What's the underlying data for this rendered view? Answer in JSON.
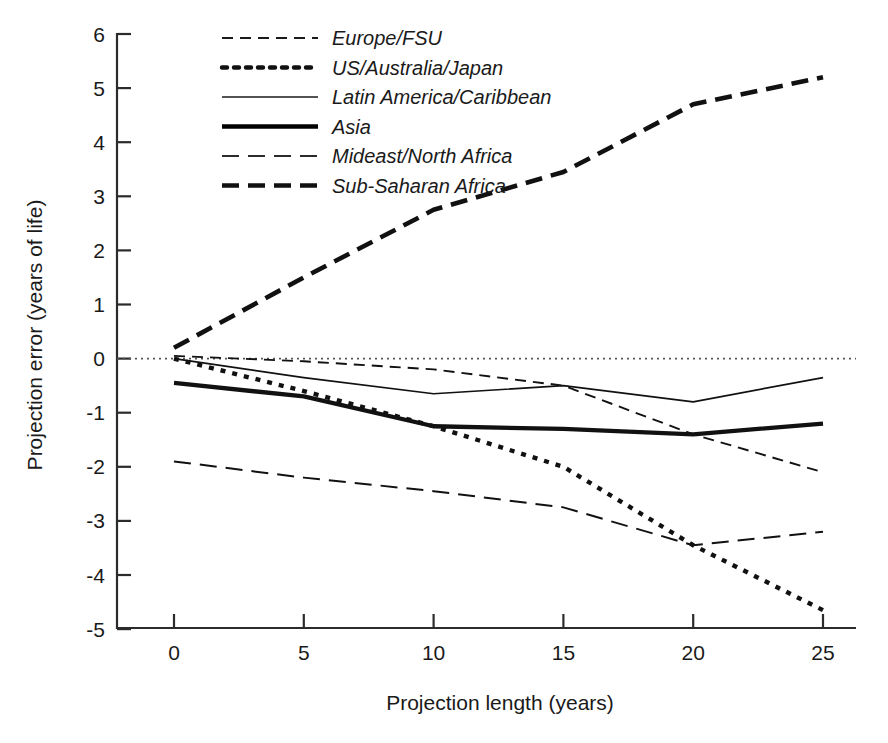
{
  "chart_data": {
    "type": "line",
    "title": "",
    "xlabel": "Projection length (years)",
    "ylabel": "Projection error (years of life)",
    "x": [
      0,
      5,
      10,
      15,
      20,
      25
    ],
    "xlim": [
      -1.5,
      26.5
    ],
    "ylim": [
      -5,
      6
    ],
    "xticks": [
      "0",
      "5",
      "10",
      "15",
      "20",
      "25"
    ],
    "yticks": [
      "6",
      "5",
      "4",
      "3",
      "2",
      "1",
      "0",
      "-1",
      "-2",
      "-3",
      "-4",
      "-5"
    ],
    "grid": false,
    "legend_position": "top-left-inside",
    "zero_reference_line": 0,
    "series": [
      {
        "name": "Europe/FSU",
        "style": "dashed-thin",
        "color": "#1a1a1a",
        "values": [
          0.05,
          -0.05,
          -0.2,
          -0.5,
          -1.4,
          -2.1
        ]
      },
      {
        "name": "US/Australia/Japan",
        "style": "dotted-bold",
        "color": "#111111",
        "values": [
          0.0,
          -0.6,
          -1.25,
          -2.0,
          -3.45,
          -4.65
        ]
      },
      {
        "name": "Latin America/Caribbean",
        "style": "solid-thin",
        "color": "#1a1a1a",
        "values": [
          0.0,
          -0.35,
          -0.65,
          -0.5,
          -0.8,
          -0.35
        ]
      },
      {
        "name": "Asia",
        "style": "solid-bold",
        "color": "#000000",
        "values": [
          -0.45,
          -0.7,
          -1.25,
          -1.3,
          -1.4,
          -1.2
        ]
      },
      {
        "name": "Mideast/North Africa",
        "style": "longdash-thin",
        "color": "#2b2b2b",
        "values": [
          -1.9,
          -2.2,
          -2.45,
          -2.75,
          -3.45,
          -3.2
        ]
      },
      {
        "name": "Sub-Saharan Africa",
        "style": "dashed-bold",
        "color": "#111111",
        "values": [
          0.2,
          1.5,
          2.75,
          3.45,
          4.7,
          5.2
        ]
      }
    ]
  },
  "legend": {
    "items": [
      {
        "label": "Europe/FSU"
      },
      {
        "label": "US/Australia/Japan"
      },
      {
        "label": "Latin America/Caribbean"
      },
      {
        "label": "Asia"
      },
      {
        "label": "Mideast/North Africa"
      },
      {
        "label": "Sub-Saharan Africa"
      }
    ]
  },
  "axes": {
    "x_title": "Projection length (years)",
    "y_title": "Projection error (years of life)",
    "x_tick_labels": [
      "0",
      "5",
      "10",
      "15",
      "20",
      "25"
    ],
    "y_tick_labels": [
      "6",
      "5",
      "4",
      "3",
      "2",
      "1",
      "0",
      "-1",
      "-2",
      "-3",
      "-4",
      "-5"
    ]
  }
}
